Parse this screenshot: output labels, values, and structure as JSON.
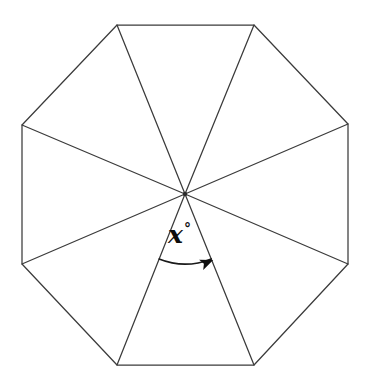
{
  "figure": {
    "type": "geometry-diagram",
    "shape_name": "regular octagon",
    "background_color": "#ffffff",
    "line_color": "#3b3b3b",
    "label_color": "#0d0d0d",
    "canvas": {
      "width": 368,
      "height": 389
    },
    "center": {
      "x": 185,
      "y": 194
    },
    "vertices": [
      {
        "name": "top-left",
        "x": 117,
        "y": 25
      },
      {
        "name": "top-right",
        "x": 254,
        "y": 25
      },
      {
        "name": "right-upper",
        "x": 348,
        "y": 124
      },
      {
        "name": "right-lower",
        "x": 348,
        "y": 264
      },
      {
        "name": "bottom-right",
        "x": 254,
        "y": 365
      },
      {
        "name": "bottom-left",
        "x": 117,
        "y": 365
      },
      {
        "name": "left-lower",
        "x": 22,
        "y": 264
      },
      {
        "name": "left-upper",
        "x": 22,
        "y": 125
      }
    ],
    "spoke_count": 8,
    "angle_marker": {
      "label_text": "x",
      "degree_symbol": "°",
      "label_x": 168,
      "label_y": 228,
      "arc_radius": 70,
      "arc_start": {
        "x": 160,
        "y": 259
      },
      "arc_end": {
        "x": 209,
        "y": 260
      },
      "arrow_direction": "clockwise-right",
      "between_vertices": [
        "bottom-left",
        "bottom-right"
      ]
    }
  }
}
